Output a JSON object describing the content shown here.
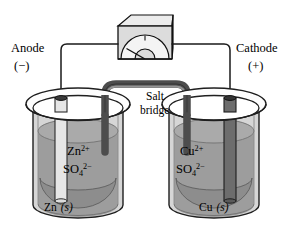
{
  "figure": {
    "background_color": "#ffffff",
    "outline_color": "#000000"
  },
  "labels": {
    "anode": "Anode",
    "anode_sign": "(−)",
    "cathode": "Cathode",
    "cathode_sign": "(+)",
    "salt_bridge_line1": "Salt",
    "salt_bridge_line2": "bridge"
  },
  "left_cell": {
    "name": "anode-half-cell",
    "ion_cation": "Zn",
    "ion_cation_charge": "2+",
    "ion_anion": "SO",
    "ion_anion_sub": "4",
    "ion_anion_charge": "2−",
    "electrode_label": "Zn",
    "electrode_state": "(s)",
    "electrode_color": "#e3e3e3",
    "solution_color": "#9d9d9d"
  },
  "right_cell": {
    "name": "cathode-half-cell",
    "ion_cation": "Cu",
    "ion_cation_charge": "2+",
    "ion_anion": "SO",
    "ion_anion_sub": "4",
    "ion_anion_charge": "2−",
    "electrode_label": "Cu",
    "electrode_state": "(s)",
    "electrode_color": "#6d6d6d",
    "solution_color": "#9d9d9d"
  },
  "meter": {
    "name": "voltmeter",
    "body_color": "#dcdcdc",
    "top_color": "#ececec",
    "dial_color": "#f4f4f4"
  },
  "salt_bridge": {
    "tube_color": "#555555",
    "highlight_color": "#8a8a8a"
  },
  "colors": {
    "beaker_glass": "#c8c8c8",
    "beaker_rim": "#fdfdfd",
    "liquid": "#9d9d9d",
    "liquid_bottom": "#8a8a8a",
    "wire": "#1a1a1a"
  }
}
